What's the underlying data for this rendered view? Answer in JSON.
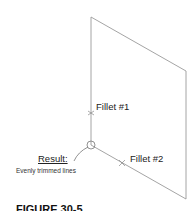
{
  "diagram": {
    "labels": {
      "fillet1": "Fillet #1",
      "fillet2": "Fillet #2",
      "result": "Result:",
      "result_desc": "Evenly trimmed lines",
      "figure_caption": "FIGURE 30-5"
    },
    "geometry": {
      "top_left": [
        91,
        17
      ],
      "top_right": [
        186,
        71
      ],
      "bottom_right": [
        186,
        199
      ],
      "corner": [
        91,
        145
      ],
      "fillet1_marker": [
        91,
        113
      ],
      "fillet2_marker": [
        122,
        163
      ]
    },
    "colors": {
      "line": "#9a9a9a",
      "text": "#222222"
    }
  }
}
